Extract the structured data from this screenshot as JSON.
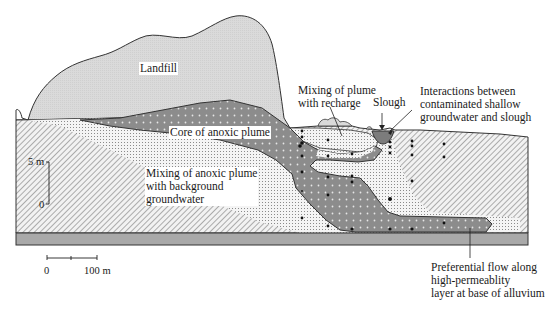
{
  "figure": {
    "type": "geologic-cross-section",
    "labels": {
      "landfill": "Landfill",
      "core_plume": "Core of anoxic plume",
      "mixing_recharge": "Mixing of plume\nwith recharge",
      "slough": "Slough",
      "interactions": "Interactions between\ncontaminated shallow\ngroundwater and slough",
      "mixing_background": "Mixing of anoxic plume\nwith background\ngroundwater",
      "preferential_flow": "Preferential flow along\nhigh-permeablity\nlayer at base of alluvium"
    },
    "vertical_scale": {
      "top_label": "5 m",
      "bottom_label": "0"
    },
    "horizontal_scale": {
      "left_label": "0",
      "right_label": "100 m"
    },
    "colors": {
      "landfill_fill": "#d8d8d8",
      "plume_core_fill": "#8a8a8a",
      "mixing_fill": "#e8e8e8",
      "base_layer_fill": "#a8a8a8",
      "outline": "#333333",
      "background": "#ffffff"
    }
  }
}
